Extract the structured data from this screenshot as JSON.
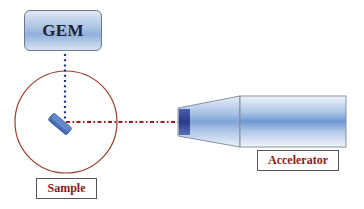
{
  "diagram": {
    "title": "",
    "nodes": {
      "gem": {
        "label": "GEM"
      },
      "sample": {
        "label": "Sample"
      },
      "accelerator": {
        "label": "Accelerator"
      }
    },
    "edges": [
      {
        "from": "gem",
        "to": "sample",
        "style": "dotted",
        "color": "#1f2f8a"
      },
      {
        "from": "accelerator",
        "to": "sample",
        "style": "dash-dot",
        "color": "#a31c1c"
      }
    ],
    "shapes": {
      "sample_circle": {
        "stroke": "#9c3a2c"
      },
      "sample_target": {
        "fill": "#4a78c0"
      },
      "accelerator_body": {
        "fill": "#6f99d3"
      },
      "accelerator_tip": {
        "fill": "#2d3f8f"
      }
    }
  }
}
